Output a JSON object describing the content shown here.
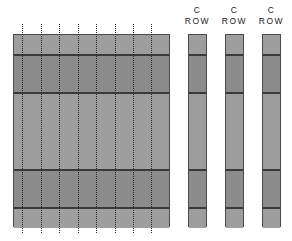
{
  "diagram": {
    "main_grid": {
      "x": 13,
      "y": 34,
      "width": 157,
      "height": 193,
      "bands": [
        {
          "top": 0,
          "height": 20,
          "shade": "light"
        },
        {
          "top": 20,
          "height": 38,
          "shade": "dark"
        },
        {
          "top": 58,
          "height": 77,
          "shade": "light"
        },
        {
          "top": 135,
          "height": 38,
          "shade": "dark"
        },
        {
          "top": 173,
          "height": 20,
          "shade": "light"
        }
      ],
      "row_lines_y": [
        20,
        58,
        135,
        173
      ],
      "dotted_columns_x": [
        22,
        41,
        59,
        78,
        96,
        115,
        133,
        151
      ],
      "dotted_top": 24,
      "dotted_bottom": 233
    },
    "c_rows": [
      {
        "label_line1": "C",
        "label_line2": "ROW",
        "x": 188,
        "width": 19
      },
      {
        "label_line1": "C",
        "label_line2": "ROW",
        "x": 225,
        "width": 19
      },
      {
        "label_line1": "C",
        "label_line2": "ROW",
        "x": 262,
        "width": 19
      }
    ],
    "colors": {
      "light": "#9e9e9e",
      "dark": "#8c8c8c",
      "line": "#3a3a3a",
      "border": "#4a4a4a"
    }
  }
}
